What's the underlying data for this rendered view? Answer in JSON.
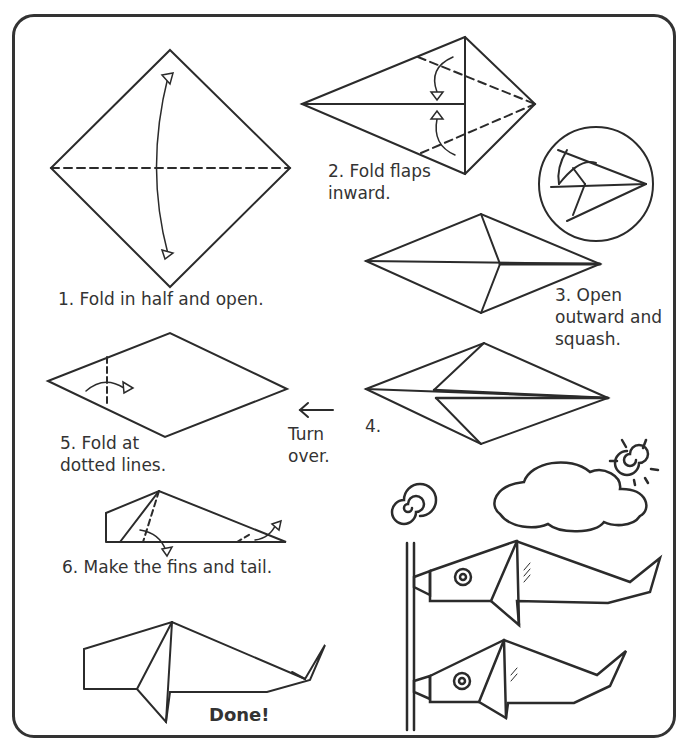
{
  "page": {
    "accent_color": "#333333",
    "background_color": "#ffffff"
  },
  "steps": [
    {
      "id": "step-1",
      "label": "1. Fold in half and open."
    },
    {
      "id": "step-2",
      "label": "2. Fold flaps\ninward."
    },
    {
      "id": "step-3",
      "label": "3. Open\noutward and\nsquash."
    },
    {
      "id": "step-4",
      "label": "4."
    },
    {
      "id": "step-5",
      "label": "5. Fold at\ndotted lines."
    },
    {
      "id": "step-6",
      "label": "6. Make the fins and tail."
    }
  ],
  "turn_over": {
    "label": "Turn\nover.",
    "icon": "arrow-left-icon"
  },
  "done": {
    "label": "Done!"
  },
  "illustrations": [
    "square-diamond-fold",
    "kite-flaps",
    "detail-circle-squash",
    "squashed-diamond",
    "kite-step-4",
    "rhombus-fold-lines",
    "whale-fins-tail",
    "finished-whale",
    "sun-icon",
    "cloud-icon",
    "fish-streamers-pole"
  ]
}
